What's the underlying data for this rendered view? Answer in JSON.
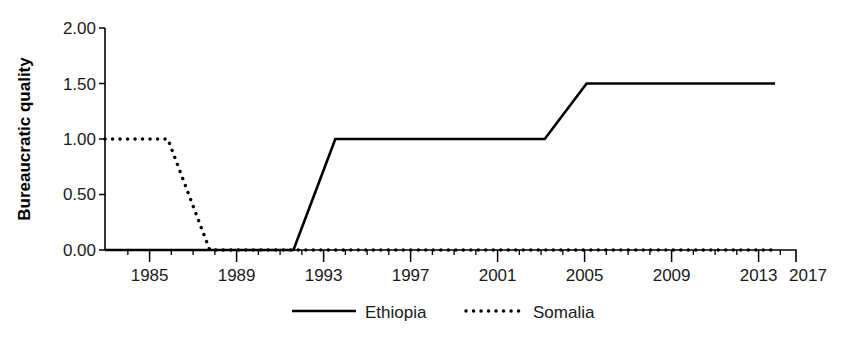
{
  "chart_data": {
    "type": "line",
    "title": "",
    "xlabel": "",
    "ylabel": "Bureaucratic quality",
    "xlim": [
      1984,
      2017
    ],
    "ylim": [
      0.0,
      2.0
    ],
    "yticks": [
      "0.00",
      "0.50",
      "1.00",
      "1.50",
      "2.00"
    ],
    "ytick_values": [
      0.0,
      0.5,
      1.0,
      1.5,
      2.0
    ],
    "xticks": [
      "1985",
      "1989",
      "1993",
      "1997",
      "2001",
      "2005",
      "2009",
      "2013",
      "2017"
    ],
    "xtick_values": [
      1985,
      1989,
      1993,
      1997,
      2001,
      2005,
      2009,
      2013,
      2017
    ],
    "grid": false,
    "legend_position": "bottom-center",
    "series": [
      {
        "name": "Ethiopia",
        "style": "solid",
        "color": "#000000",
        "x": [
          1984,
          1985,
          1986,
          1987,
          1988,
          1989,
          1990,
          1991,
          1992,
          1993,
          1994,
          1995,
          1996,
          1997,
          1998,
          1999,
          2000,
          2001,
          2002,
          2003,
          2004,
          2005,
          2006,
          2007,
          2008,
          2009,
          2010,
          2011,
          2012,
          2013,
          2014,
          2015,
          2016
        ],
        "values": [
          0.0,
          0.0,
          0.0,
          0.0,
          0.0,
          0.0,
          0.0,
          0.0,
          0.0,
          0.0,
          0.5,
          1.0,
          1.0,
          1.0,
          1.0,
          1.0,
          1.0,
          1.0,
          1.0,
          1.0,
          1.0,
          1.0,
          1.25,
          1.5,
          1.5,
          1.5,
          1.5,
          1.5,
          1.5,
          1.5,
          1.5,
          1.5,
          1.5
        ]
      },
      {
        "name": "Somalia",
        "style": "dotted",
        "color": "#000000",
        "x": [
          1984,
          1985,
          1986,
          1987,
          1988,
          1989,
          1990,
          1991,
          1992,
          1993,
          1994,
          1995,
          1996,
          1997,
          1998,
          1999,
          2000,
          2001,
          2002,
          2003,
          2004,
          2005,
          2006,
          2007,
          2008,
          2009,
          2010,
          2011,
          2012,
          2013,
          2014,
          2015,
          2016
        ],
        "values": [
          1.0,
          1.0,
          1.0,
          1.0,
          0.5,
          0.0,
          0.0,
          0.0,
          0.0,
          0.0,
          0.0,
          0.0,
          0.0,
          0.0,
          0.0,
          0.0,
          0.0,
          0.0,
          0.0,
          0.0,
          0.0,
          0.0,
          0.0,
          0.0,
          0.0,
          0.0,
          0.0,
          0.0,
          0.0,
          0.0,
          0.0,
          0.0,
          0.0
        ]
      }
    ]
  },
  "legend": {
    "entries": [
      {
        "label": "Ethiopia",
        "style": "solid"
      },
      {
        "label": "Somalia",
        "style": "dotted"
      }
    ]
  },
  "axes": {
    "y_title": "Bureaucratic quality"
  }
}
